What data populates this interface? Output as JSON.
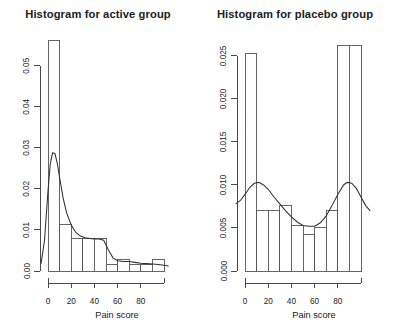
{
  "figure": {
    "background_color": "#ffffff",
    "axis_color": "#4a4a4a",
    "bar_stroke_color": "#555555",
    "curve_color": "#303030",
    "panel_count": 2
  },
  "panels": [
    {
      "key": "active",
      "title": "Histogram for active group",
      "xlabel": "Pain score",
      "ylabel": ""
    },
    {
      "key": "placebo",
      "title": "Histogram for placebo group",
      "xlabel": "Pain score",
      "ylabel": ""
    }
  ],
  "chart_data": [
    {
      "type": "bar",
      "title": "Histogram for active group",
      "xlabel": "Pain score",
      "ylabel": "",
      "grid": false,
      "legend": "none",
      "xlim": [
        0,
        100
      ],
      "ylim": [
        0,
        0.057
      ],
      "xticks": [
        0,
        20,
        40,
        60,
        80
      ],
      "xtick_labels": [
        "0",
        "20",
        "40",
        "60",
        "80"
      ],
      "yticks": [
        0.0,
        0.01,
        0.02,
        0.03,
        0.04,
        0.05
      ],
      "ytick_labels": [
        "0.00",
        "0.01",
        "0.02",
        "0.03",
        "0.04",
        "0.05"
      ],
      "bin_edges": [
        0,
        10,
        20,
        30,
        40,
        50,
        60,
        70,
        80,
        90,
        100
      ],
      "categories": [
        "0-10",
        "10-20",
        "20-30",
        "30-40",
        "40-50",
        "50-60",
        "60-70",
        "70-80",
        "80-90",
        "90-100"
      ],
      "values": [
        0.0562,
        0.0113,
        0.0078,
        0.0078,
        0.0078,
        0.0017,
        0.0028,
        0.0017,
        0.0017,
        0.0028
      ],
      "density_curve": {
        "name": "kernel density estimate",
        "x": [
          -6,
          -3,
          0,
          2,
          4,
          6,
          8,
          10,
          13,
          16,
          20,
          24,
          28,
          32,
          36,
          40,
          44,
          48,
          52,
          56,
          60,
          65,
          70,
          75,
          80,
          85,
          90,
          95,
          100,
          104
        ],
        "y": [
          0.0018,
          0.0075,
          0.0195,
          0.0262,
          0.0288,
          0.0286,
          0.0262,
          0.0228,
          0.0178,
          0.0142,
          0.0112,
          0.0094,
          0.0085,
          0.0081,
          0.0079,
          0.0078,
          0.0078,
          0.0075,
          0.0052,
          0.0032,
          0.0025,
          0.0023,
          0.0023,
          0.0021,
          0.0019,
          0.0018,
          0.0017,
          0.0016,
          0.0014,
          0.0012
        ]
      }
    },
    {
      "type": "bar",
      "title": "Histogram for placebo group",
      "xlabel": "Pain score",
      "ylabel": "",
      "grid": false,
      "legend": "none",
      "xlim": [
        0,
        100
      ],
      "ylim": [
        0,
        0.0272
      ],
      "xticks": [
        0,
        20,
        40,
        60,
        80
      ],
      "xtick_labels": [
        "0",
        "20",
        "40",
        "60",
        "80"
      ],
      "yticks": [
        0.0,
        0.005,
        0.01,
        0.015,
        0.02,
        0.025
      ],
      "ytick_labels": [
        "0.000",
        "0.005",
        "0.010",
        "0.015",
        "0.020",
        "0.025"
      ],
      "bin_edges": [
        0,
        10,
        20,
        30,
        40,
        50,
        60,
        70,
        80,
        90,
        100
      ],
      "categories": [
        "0-10",
        "10-20",
        "20-30",
        "30-40",
        "40-50",
        "50-60",
        "60-70",
        "70-80",
        "80-90",
        "90-100"
      ],
      "values": [
        0.0253,
        0.007,
        0.007,
        0.0076,
        0.0053,
        0.0043,
        0.0051,
        0.007,
        0.0262,
        0.0262
      ],
      "density_curve": {
        "name": "kernel density estimate",
        "x": [
          -8,
          -4,
          0,
          4,
          8,
          12,
          16,
          20,
          25,
          30,
          35,
          40,
          45,
          50,
          55,
          60,
          65,
          70,
          75,
          80,
          85,
          88,
          92,
          96,
          100,
          104,
          108
        ],
        "y": [
          0.0078,
          0.0082,
          0.0089,
          0.0097,
          0.0102,
          0.0103,
          0.01,
          0.0095,
          0.0086,
          0.0078,
          0.007,
          0.0063,
          0.0057,
          0.0053,
          0.0052,
          0.0052,
          0.0056,
          0.0064,
          0.0076,
          0.0089,
          0.01,
          0.0103,
          0.0102,
          0.0096,
          0.0086,
          0.0076,
          0.007
        ]
      }
    }
  ]
}
